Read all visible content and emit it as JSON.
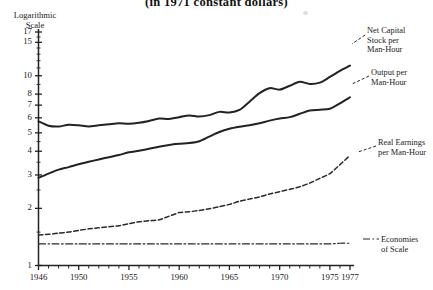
{
  "title": "(in 1971 constant dollars)",
  "axis_caption": {
    "line1": "Logarithmic",
    "line2": "Scale"
  },
  "labels": {
    "net_capital": {
      "l1": "Net Capital",
      "l2": "Stock per",
      "l3": "Man-Hour"
    },
    "output": {
      "l1": "Output per",
      "l2": "Man-Hour"
    },
    "real_earnings": {
      "l1": "Real Earnings",
      "l2": "per Man-Hour"
    },
    "economies": {
      "l1": "Economies",
      "l2": "of Scale"
    }
  },
  "chart_data": {
    "type": "line",
    "title": "(in 1971 constant dollars)",
    "xlabel": "",
    "ylabel": "Logarithmic Scale",
    "yscale": "log",
    "ylim": [
      1,
      18
    ],
    "xlim": [
      1946,
      1977
    ],
    "grid": false,
    "legend": "right-inline-labels",
    "ytick_labels": [
      "17",
      "15",
      "10",
      "8",
      "7",
      "6",
      "5",
      "4",
      "3",
      "2",
      "1"
    ],
    "ytick_values": [
      17,
      15,
      10,
      8,
      7,
      6,
      5,
      4,
      3,
      2,
      1
    ],
    "xtick_labels": [
      "1946",
      "1950",
      "1955",
      "1960",
      "1965",
      "1970",
      "1975",
      "1977"
    ],
    "xtick_values": [
      1946,
      1950,
      1955,
      1960,
      1965,
      1970,
      1975,
      1977
    ],
    "x": [
      1946,
      1947,
      1948,
      1949,
      1950,
      1951,
      1952,
      1953,
      1954,
      1955,
      1956,
      1957,
      1958,
      1959,
      1960,
      1961,
      1962,
      1963,
      1964,
      1965,
      1966,
      1967,
      1968,
      1969,
      1970,
      1971,
      1972,
      1973,
      1974,
      1975,
      1976,
      1977
    ],
    "series": [
      {
        "name": "Net Capital Stock per Man-Hour",
        "style": "solid",
        "color": "#222222",
        "values": [
          5.75,
          5.45,
          5.4,
          5.52,
          5.48,
          5.4,
          5.48,
          5.55,
          5.62,
          5.58,
          5.65,
          5.78,
          5.95,
          5.92,
          6.05,
          6.18,
          6.1,
          6.2,
          6.45,
          6.4,
          6.6,
          7.3,
          8.1,
          8.6,
          8.45,
          8.85,
          9.3,
          9.05,
          9.2,
          9.85,
          10.6,
          11.3
        ]
      },
      {
        "name": "Output per Man-Hour",
        "style": "solid",
        "color": "#222222",
        "values": [
          2.9,
          3.05,
          3.2,
          3.3,
          3.42,
          3.52,
          3.62,
          3.72,
          3.82,
          3.95,
          4.02,
          4.12,
          4.22,
          4.32,
          4.38,
          4.42,
          4.52,
          4.78,
          5.05,
          5.25,
          5.38,
          5.48,
          5.62,
          5.8,
          5.95,
          6.05,
          6.3,
          6.55,
          6.62,
          6.7,
          7.15,
          7.7
        ]
      },
      {
        "name": "Real Earnings per Man-Hour",
        "style": "dashed",
        "color": "#2a2a2a",
        "values": [
          1.45,
          1.46,
          1.48,
          1.5,
          1.53,
          1.56,
          1.58,
          1.6,
          1.62,
          1.66,
          1.7,
          1.72,
          1.74,
          1.82,
          1.9,
          1.92,
          1.95,
          1.99,
          2.04,
          2.1,
          2.18,
          2.24,
          2.3,
          2.38,
          2.45,
          2.52,
          2.6,
          2.72,
          2.88,
          3.05,
          3.4,
          3.8
        ]
      },
      {
        "name": "Economies of Scale",
        "style": "dashdot",
        "color": "#2a2a2a",
        "values": [
          1.3,
          1.3,
          1.3,
          1.3,
          1.3,
          1.3,
          1.3,
          1.3,
          1.3,
          1.3,
          1.3,
          1.3,
          1.3,
          1.3,
          1.3,
          1.3,
          1.3,
          1.3,
          1.3,
          1.3,
          1.3,
          1.3,
          1.3,
          1.3,
          1.3,
          1.3,
          1.3,
          1.3,
          1.3,
          1.3,
          1.31,
          1.31
        ]
      }
    ]
  }
}
